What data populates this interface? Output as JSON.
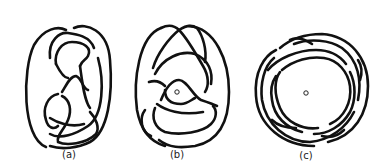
{
  "figure": {
    "panels": [
      {
        "id": "a",
        "label": "(a)",
        "description": "knot diagram",
        "has_center_point": false
      },
      {
        "id": "b",
        "label": "(b)",
        "description": "knot diagram with center point",
        "has_center_point": true
      },
      {
        "id": "c",
        "label": "(c)",
        "description": "braided knot diagram with center point",
        "has_center_point": true
      }
    ],
    "colors": {
      "stroke": "#111111",
      "background": "#ffffff"
    }
  }
}
